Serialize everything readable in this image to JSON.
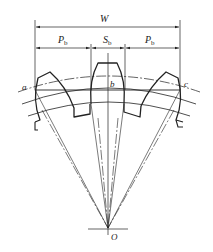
{
  "figure": {
    "type": "gear base tangent length (span measurement) diagram",
    "labels": {
      "W": "W",
      "Pb_left_main": "P",
      "Pb_left_sub": "b",
      "Sb_main": "S",
      "Sb_sub": "b",
      "Pb_right_main": "P",
      "Pb_right_sub": "b",
      "point_a": "a",
      "point_b": "b",
      "point_c": "c",
      "center": "O"
    },
    "dimensions": [
      {
        "name": "W",
        "from_point": "a",
        "to_point": "c"
      },
      {
        "name": "Pb",
        "position": "left"
      },
      {
        "name": "Sb",
        "position": "center"
      },
      {
        "name": "Pb",
        "position": "right"
      }
    ],
    "teeth_count_shown": 3,
    "colors": {
      "line": "#222222",
      "background": "#ffffff"
    }
  }
}
